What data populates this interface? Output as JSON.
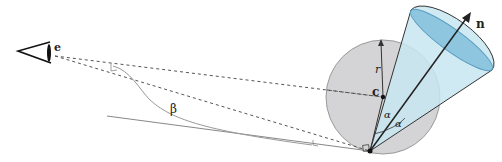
{
  "diagram": {
    "labels": {
      "eye": "e",
      "center": "c",
      "radius": "r",
      "normal": "n",
      "beta": "β",
      "alpha_left": "α",
      "alpha_right": "α"
    },
    "colors": {
      "sphere_fill": "#d4d4d6",
      "sphere_stroke": "#9a9a9a",
      "cone_fill": "#c8e6f1",
      "cone_cap": "#8ec5df",
      "line": "#222222",
      "dashed": "#555555",
      "thin": "#888888"
    }
  }
}
